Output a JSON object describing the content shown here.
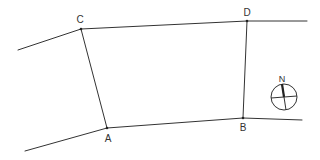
{
  "diagram": {
    "type": "survey-plot",
    "stroke_color": "#333333",
    "background": "#ffffff",
    "points": {
      "A": {
        "label": "A",
        "x": 107,
        "y": 128,
        "lx": 108,
        "ly": 142
      },
      "B": {
        "label": "B",
        "x": 243,
        "y": 118,
        "lx": 243,
        "ly": 131
      },
      "C": {
        "label": "C",
        "x": 81,
        "y": 29,
        "lx": 80,
        "ly": 23
      },
      "D": {
        "label": "D",
        "x": 247,
        "y": 21,
        "lx": 247,
        "ly": 16
      }
    },
    "north_arrow": {
      "label": "N",
      "icon": "north-arrow-compass-icon",
      "cx": 284,
      "cy": 97,
      "r": 13
    }
  }
}
